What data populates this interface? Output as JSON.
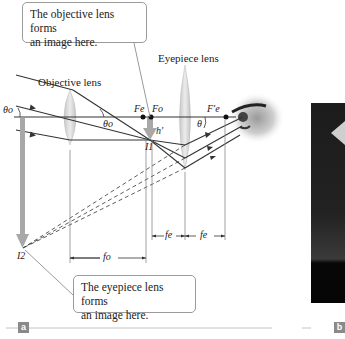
{
  "figure": {
    "panel_a": {
      "tag": "a",
      "callout_top": {
        "line1": "The objective lens forms",
        "line2": "an image here."
      },
      "callout_bottom": {
        "line1": "The eyepiece lens forms",
        "line2": "an image here."
      },
      "labels": {
        "objective_lens": "Objective lens",
        "eyepiece_lens": "Eyepiece lens",
        "theta_o_left": "θo",
        "theta_o_inner": "θo",
        "theta": "θ",
        "F_e": "Fe",
        "F_o": "Fo",
        "F_e_prime": "F′e",
        "h_prime": "h′",
        "I1": "I1",
        "I2": "I2",
        "f_o": "fo",
        "f_e_1": "fe",
        "f_e_2": "fe"
      }
    },
    "panel_b": {
      "tag": "b"
    },
    "colors": {
      "ray": "#333333",
      "lens": "#d6d6d6",
      "image_arrow": "#a8a8a8",
      "callout_border": "#9a9a9a",
      "tag_bg": "#8a8a8a"
    }
  }
}
